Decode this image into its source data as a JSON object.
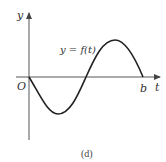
{
  "diagram": {
    "type": "function-graph",
    "curve_label": "y = f(t)",
    "y_axis_label": "y",
    "x_axis_label": "t",
    "origin_label": "O",
    "end_label": "b",
    "caption": "(d)",
    "colors": {
      "curve": "#222222",
      "axes": "#555555"
    }
  }
}
